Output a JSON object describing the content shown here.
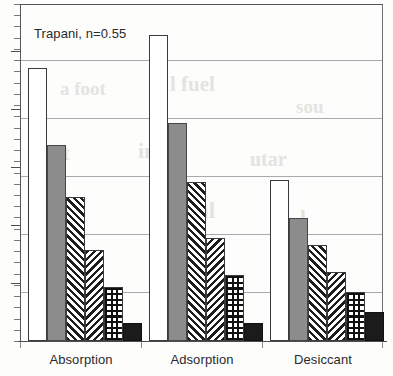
{
  "chart_data": {
    "type": "bar",
    "title": "",
    "annotation": "Trapani, n=0.55",
    "xlabel": "",
    "ylabel": "",
    "categories": [
      "Absorption",
      "Adsorption",
      "Desiccant"
    ],
    "ylim": [
      0,
      5.81
    ],
    "grid": true,
    "gridlines": [
      1,
      2,
      3,
      4,
      5
    ],
    "y_tick_labels": [],
    "legend": "none",
    "legend_entries": [],
    "series": [
      {
        "name": "series-1",
        "pattern": "white",
        "color": "#ffffff",
        "values": [
          4.71,
          5.28,
          2.78
        ]
      },
      {
        "name": "series-2",
        "pattern": "solid-gray",
        "color": "#8c8c8c",
        "values": [
          3.38,
          3.76,
          2.12
        ]
      },
      {
        "name": "series-3",
        "pattern": "diagonal-up",
        "color": "#1d1d1d",
        "values": [
          2.48,
          2.74,
          1.66
        ]
      },
      {
        "name": "series-4",
        "pattern": "diagonal-down",
        "color": "#1d1d1d",
        "values": [
          1.57,
          1.78,
          1.19
        ]
      },
      {
        "name": "series-5",
        "pattern": "checkerboard",
        "color": "#101010",
        "values": [
          0.93,
          1.14,
          0.84
        ]
      },
      {
        "name": "series-6",
        "pattern": "solid-black",
        "color": "#1b1b1b",
        "values": [
          0.31,
          0.31,
          0.5
        ]
      }
    ]
  },
  "axis": {
    "minor_tick_count": 30,
    "major_tick_count": 5
  },
  "ghost_text": [
    {
      "text": "a foot",
      "x": 60,
      "y": 78,
      "size": 19
    },
    {
      "text": "l fuel",
      "x": 170,
      "y": 72,
      "size": 21
    },
    {
      "text": "sou",
      "x": 296,
      "y": 96,
      "size": 19
    },
    {
      "text": "Int",
      "x": 44,
      "y": 142,
      "size": 20
    },
    {
      "text": "inni",
      "x": 138,
      "y": 138,
      "size": 22
    },
    {
      "text": "utar",
      "x": 250,
      "y": 148,
      "size": 20
    },
    {
      "text": "t",
      "x": 30,
      "y": 200,
      "size": 22
    },
    {
      "text": "rmal",
      "x": 168,
      "y": 198,
      "size": 23
    },
    {
      "text": "l",
      "x": 300,
      "y": 206,
      "size": 21
    },
    {
      "text": "me",
      "x": 196,
      "y": 262,
      "size": 19
    }
  ]
}
